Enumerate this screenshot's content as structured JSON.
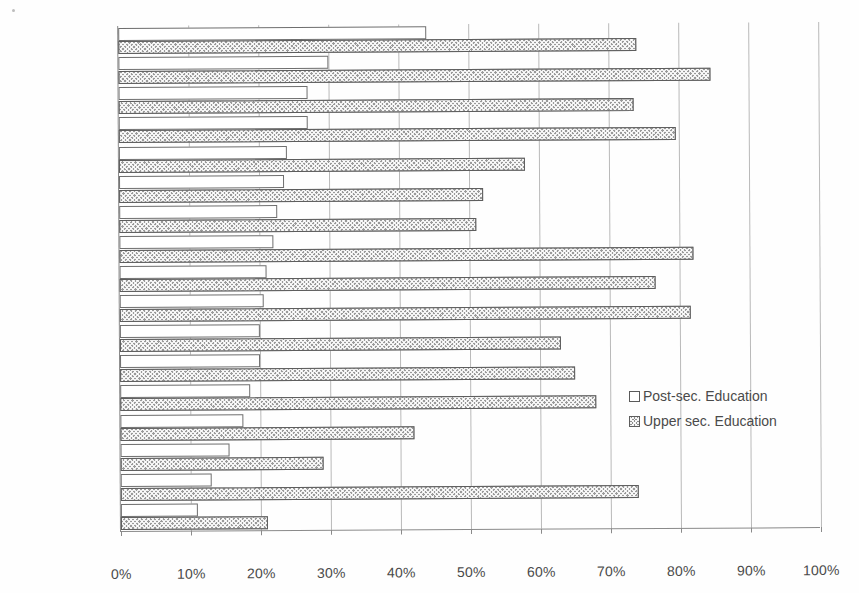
{
  "chart_data": {
    "type": "bar",
    "orientation": "horizontal",
    "grouped": true,
    "title": "",
    "subtitle": "",
    "xlabel": "",
    "ylabel": "",
    "xlim": [
      0,
      100
    ],
    "xticks": [
      0,
      10,
      20,
      30,
      40,
      50,
      60,
      70,
      80,
      90,
      100
    ],
    "xtick_labels": [
      "0%",
      "10%",
      "20%",
      "30%",
      "40%",
      "50%",
      "60%",
      "70%",
      "80%",
      "90%",
      "100%"
    ],
    "grid": "vertical",
    "legend_position": "center-right",
    "categories": [
      "Canada",
      "USA",
      "Sweden",
      "Norway",
      "New Zealand",
      "Belgium",
      "Australia",
      "Germany",
      "United Kingd.",
      "Switzerland",
      "Denmark",
      "Finland",
      "France",
      "Greece",
      "Spain",
      "Poland",
      "Portugal"
    ],
    "series": [
      {
        "name": "Post-sec. Education",
        "fill": "white",
        "values": [
          44,
          30,
          27,
          27,
          24,
          23.5,
          22.5,
          22,
          21,
          20.5,
          20,
          20,
          18.5,
          17.5,
          15.5,
          13,
          11
        ]
      },
      {
        "name": "Upper sec. Education",
        "fill": "hatched",
        "values": [
          74,
          84.5,
          73.5,
          79.5,
          58,
          52,
          51,
          82,
          76.5,
          81.5,
          63,
          65,
          68,
          42,
          29,
          74,
          21
        ]
      }
    ]
  },
  "legend": {
    "items": [
      {
        "label": "Post-sec. Education",
        "swatch": "white-square"
      },
      {
        "label": "Upper sec. Education",
        "swatch": "hatched-square"
      }
    ]
  },
  "colors": {
    "post_sec_fill": "#ffffff",
    "post_sec_border": "#6e6e6e",
    "upper_sec_fill": "#9a9a9a",
    "upper_sec_border": "#5d5d5d",
    "gridline": "#b9b9b9",
    "axis": "#8a8a8a",
    "text": "#4a4a4a",
    "background": "#fefefe"
  }
}
